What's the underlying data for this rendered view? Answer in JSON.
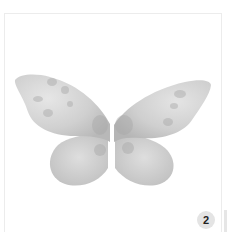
{
  "image": {
    "subject": "butterfly-wings-watercolor",
    "alt": "Grey watercolor butterfly wings"
  },
  "badge": {
    "number": "2"
  },
  "colors": {
    "wing_base": "#c9c9c9",
    "wing_light": "#e2e2e2",
    "wing_spot": "#a9a9a9",
    "badge_bg": "#e4e4e4"
  }
}
